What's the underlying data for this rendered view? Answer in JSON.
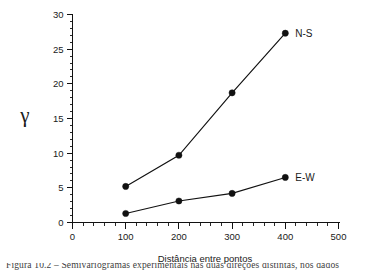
{
  "chart_data": {
    "type": "line",
    "title": "",
    "xlabel": "Distância entre pontos",
    "ylabel": "γ",
    "xlim": [
      0,
      500
    ],
    "ylim": [
      0,
      30
    ],
    "grid": false,
    "legend_position": "inline-right-of-last-point",
    "x_ticks": [
      0,
      100,
      200,
      300,
      400,
      500
    ],
    "x_tick_labels": [
      "0",
      "100",
      "200",
      "300",
      "400",
      "500"
    ],
    "x_minor_step": 20,
    "y_ticks": [
      0,
      5,
      10,
      15,
      20,
      25,
      30
    ],
    "y_tick_labels": [
      "0",
      "5",
      "10",
      "15",
      "20",
      "25",
      "30"
    ],
    "y_minor_step": 1,
    "x": [
      100,
      200,
      300,
      400
    ],
    "series": [
      {
        "name": "N-S",
        "label": "N-S",
        "color": "#111111",
        "marker": "filled-circle",
        "values": [
          5.2,
          9.7,
          18.7,
          27.3
        ]
      },
      {
        "name": "E-W",
        "label": "E-W",
        "color": "#111111",
        "marker": "filled-circle",
        "values": [
          1.3,
          3.1,
          4.2,
          6.5
        ]
      }
    ]
  },
  "caption": {
    "text": "Figura 10.2 – Semivariogramas experimentais nas duas direções distintas, nos dados"
  },
  "colors": {
    "background": "#ffffff",
    "ink": "#111111",
    "caption": "#3d3d3d"
  }
}
